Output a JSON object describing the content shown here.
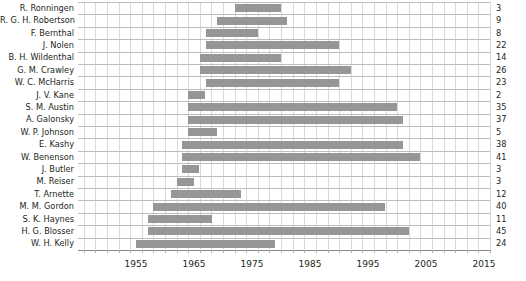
{
  "chart_data": {
    "type": "bar",
    "orientation": "horizontal-gantt",
    "title": "",
    "xlabel": "",
    "ylabel": "",
    "xlim": [
      1945,
      2016
    ],
    "grid": true,
    "legend": null,
    "axis": {
      "major_ticks": [
        1955,
        1965,
        1975,
        1985,
        1995,
        2005,
        2015
      ],
      "tick_labels": [
        "1955",
        "1965",
        "1975",
        "1985",
        "1995",
        "2005",
        "2015"
      ],
      "minor_tick_step": 2
    },
    "value_column_header": "",
    "bar_color": "#969696",
    "grid_color": "#d9d9d9",
    "grid_major_color": "#9a9a9a",
    "text_color": "#231f20",
    "categories": [
      "R. Ronningen",
      "R. G. H. Robertson",
      "F. Bernthal",
      "J. Nolen",
      "B. H. Wildenthal",
      "G. M. Crawley",
      "W. C. McHarris",
      "J. V. Kane",
      "S. M. Austin",
      "A. Galonsky",
      "W. P. Johnson",
      "E. Kashy",
      "W. Benenson",
      "J. Butler",
      "M. Reiser",
      "T. Arnette",
      "M. M. Gordon",
      "S. K. Haynes",
      "H. G. Blosser",
      "W. H. Kelly"
    ],
    "values": [
      3,
      9,
      8,
      22,
      14,
      26,
      23,
      2,
      35,
      37,
      5,
      38,
      41,
      3,
      3,
      12,
      40,
      11,
      45,
      24
    ],
    "spans": [
      {
        "name": "R. Ronningen",
        "start": 1972,
        "end": 1980,
        "value": 3
      },
      {
        "name": "R. G. H. Robertson",
        "start": 1969,
        "end": 1981,
        "value": 9
      },
      {
        "name": "F. Bernthal",
        "start": 1967,
        "end": 1976,
        "value": 8
      },
      {
        "name": "J. Nolen",
        "start": 1967,
        "end": 1990,
        "value": 22
      },
      {
        "name": "B. H. Wildenthal",
        "start": 1966,
        "end": 1980,
        "value": 14
      },
      {
        "name": "G. M. Crawley",
        "start": 1966,
        "end": 1992,
        "value": 26
      },
      {
        "name": "W. C. McHarris",
        "start": 1967,
        "end": 1990,
        "value": 23
      },
      {
        "name": "J. V. Kane",
        "start": 1964,
        "end": 1967,
        "value": 2
      },
      {
        "name": "S. M. Austin",
        "start": 1964,
        "end": 2000,
        "value": 35
      },
      {
        "name": "A. Galonsky",
        "start": 1964,
        "end": 2001,
        "value": 37
      },
      {
        "name": "W. P. Johnson",
        "start": 1964,
        "end": 1969,
        "value": 5
      },
      {
        "name": "E. Kashy",
        "start": 1963,
        "end": 2001,
        "value": 38
      },
      {
        "name": "W. Benenson",
        "start": 1963,
        "end": 2004,
        "value": 41
      },
      {
        "name": "J. Butler",
        "start": 1963,
        "end": 1966,
        "value": 3
      },
      {
        "name": "M. Reiser",
        "start": 1962,
        "end": 1965,
        "value": 3
      },
      {
        "name": "T. Arnette",
        "start": 1961,
        "end": 1973,
        "value": 12
      },
      {
        "name": "M. M. Gordon",
        "start": 1958,
        "end": 1998,
        "value": 40
      },
      {
        "name": "S. K. Haynes",
        "start": 1957,
        "end": 1968,
        "value": 11
      },
      {
        "name": "H. G. Blosser",
        "start": 1957,
        "end": 2002,
        "value": 45
      },
      {
        "name": "W. H. Kelly",
        "start": 1955,
        "end": 1979,
        "value": 24
      }
    ]
  }
}
